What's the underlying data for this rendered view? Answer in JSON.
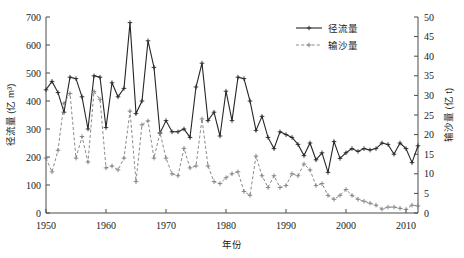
{
  "chart_data": {
    "type": "line",
    "title": "",
    "xlabel": "年份",
    "ylabel": "径流量 (亿 m³)",
    "y2label": "输沙量 (亿 t)",
    "xlim": [
      1950,
      2012
    ],
    "ylim": [
      0,
      700
    ],
    "y2lim": [
      0,
      50
    ],
    "xticks": [
      1950,
      1960,
      1970,
      1980,
      1990,
      2000,
      2010
    ],
    "yticks": [
      0,
      100,
      200,
      300,
      400,
      500,
      600,
      700
    ],
    "y2ticks": [
      0,
      5,
      10,
      15,
      20,
      25,
      30,
      35,
      40,
      45,
      50
    ],
    "grid": false,
    "legend_position": "top-right",
    "x": [
      1950,
      1951,
      1952,
      1953,
      1954,
      1955,
      1956,
      1957,
      1958,
      1959,
      1960,
      1961,
      1962,
      1963,
      1964,
      1965,
      1966,
      1967,
      1968,
      1969,
      1970,
      1971,
      1972,
      1973,
      1974,
      1975,
      1976,
      1977,
      1978,
      1979,
      1980,
      1981,
      1982,
      1983,
      1984,
      1985,
      1986,
      1987,
      1988,
      1989,
      1990,
      1991,
      1992,
      1993,
      1994,
      1995,
      1996,
      1997,
      1998,
      1999,
      2000,
      2001,
      2002,
      2003,
      2004,
      2005,
      2006,
      2007,
      2008,
      2009,
      2010,
      2011,
      2012
    ],
    "series": [
      {
        "name": "径流量",
        "axis": "left",
        "unit": "亿 m³",
        "style": "solid",
        "marker": "plus",
        "color": "#262626",
        "values": [
          440,
          470,
          430,
          360,
          485,
          480,
          415,
          300,
          490,
          485,
          305,
          465,
          415,
          445,
          680,
          355,
          400,
          615,
          520,
          285,
          330,
          290,
          290,
          300,
          270,
          450,
          535,
          330,
          360,
          275,
          435,
          330,
          485,
          480,
          400,
          295,
          345,
          270,
          230,
          290,
          280,
          270,
          245,
          205,
          250,
          190,
          215,
          145,
          255,
          195,
          215,
          230,
          220,
          230,
          225,
          230,
          250,
          245,
          210,
          250,
          230,
          180,
          240
        ]
      },
      {
        "name": "输沙量",
        "axis": "right",
        "unit": "亿 t",
        "style": "dashed",
        "marker": "plus",
        "color": "#7d7d7d",
        "values": [
          14,
          10.5,
          16,
          28,
          30.5,
          14,
          19.5,
          13,
          31,
          29,
          11.5,
          12,
          11,
          14,
          26,
          8,
          22.5,
          23.5,
          14,
          20.5,
          14,
          10,
          9.5,
          16.5,
          11.5,
          12,
          24,
          12,
          8,
          7.5,
          9,
          10,
          10.5,
          5.5,
          4.5,
          14.5,
          9.5,
          6.5,
          9.5,
          6.5,
          7,
          10,
          9.5,
          12.5,
          11,
          7,
          7.5,
          4.5,
          3.5,
          4.5,
          6,
          4.5,
          3.5,
          3,
          2.5,
          2,
          1,
          1.5,
          1.5,
          1.2,
          0.9,
          2,
          1.8
        ]
      }
    ],
    "legend": [
      {
        "label": "径流量"
      },
      {
        "label": "输沙量"
      }
    ]
  },
  "axes": {
    "left_title": "径流量 (亿 m³)",
    "right_title": "输沙量 (亿 t)",
    "x_title": "年份"
  }
}
